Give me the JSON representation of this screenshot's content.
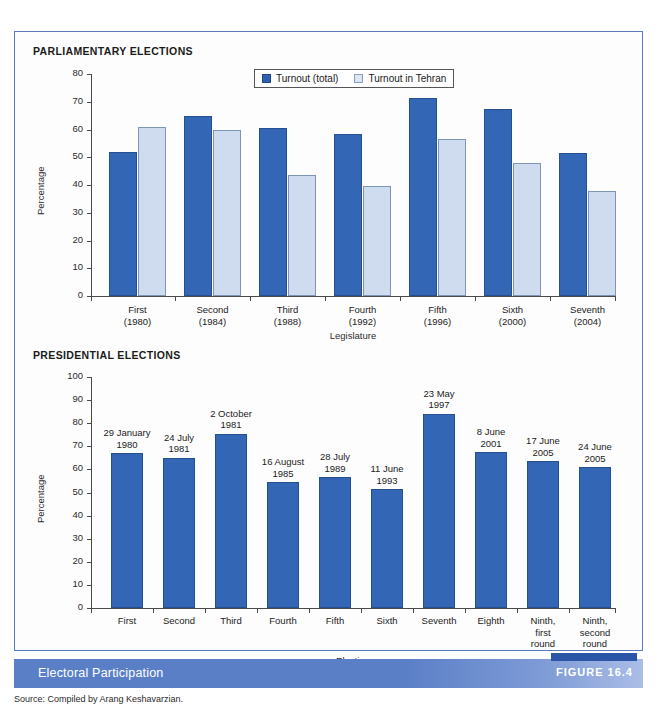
{
  "top_bleed_text": "",
  "panel": {
    "parliamentary_heading": "PARLIAMENTARY ELECTIONS",
    "presidential_heading": "PRESIDENTIAL ELECTIONS"
  },
  "legend": {
    "items": [
      {
        "label": "Turnout (total)",
        "color": "#2f5fb0"
      },
      {
        "label": "Turnout in Tehran",
        "color": "#dce6f4"
      }
    ]
  },
  "caption": {
    "title": "Electoral Participation",
    "figure_number": "FIGURE 16.4",
    "source": "Source: Compiled by Arang Keshavarzian."
  },
  "chart_data": [
    {
      "type": "bar",
      "title": "PARLIAMENTARY ELECTIONS",
      "xlabel": "Legislature",
      "ylabel": "Percentage",
      "ylim": [
        0,
        80
      ],
      "yticks": [
        0,
        10,
        20,
        30,
        40,
        50,
        60,
        70,
        80
      ],
      "grid": false,
      "legend_position": "top-center",
      "categories": [
        "First\n(1980)",
        "Second\n(1984)",
        "Third\n(1988)",
        "Fourth\n(1992)",
        "Fifth\n(1996)",
        "Sixth\n(2000)",
        "Seventh\n(2004)"
      ],
      "series": [
        {
          "name": "Turnout (total)",
          "color": "#3366b5",
          "values": [
            52,
            65,
            60.5,
            58.5,
            71.5,
            67.5,
            51.5
          ]
        },
        {
          "name": "Turnout in Tehran",
          "color": "#cfdcef",
          "values": [
            61,
            60,
            43.5,
            39.5,
            56.5,
            48,
            38
          ]
        }
      ]
    },
    {
      "type": "bar",
      "title": "PRESIDENTIAL ELECTIONS",
      "xlabel": "Election",
      "ylabel": "Percentage",
      "ylim": [
        0,
        100
      ],
      "yticks": [
        0,
        10,
        20,
        30,
        40,
        50,
        60,
        70,
        80,
        90,
        100
      ],
      "grid": false,
      "legend_position": "none",
      "categories": [
        "First",
        "Second",
        "Third",
        "Fourth",
        "Fifth",
        "Sixth",
        "Seventh",
        "Eighth",
        "Ninth,\nfirst\nround",
        "Ninth,\nsecond\nround"
      ],
      "annotations": [
        "29 January\n1980",
        "24 July\n1981",
        "2 October\n1981",
        "16 August\n1985",
        "28 July\n1989",
        "11 June\n1993",
        "23 May\n1997",
        "8 June\n2001",
        "17 June\n2005",
        "24 June\n2005"
      ],
      "series": [
        {
          "name": "Turnout",
          "color": "#3366b5",
          "values": [
            67,
            65,
            75.5,
            54.5,
            56.5,
            51.5,
            84,
            67.5,
            63.5,
            61
          ]
        }
      ]
    }
  ]
}
